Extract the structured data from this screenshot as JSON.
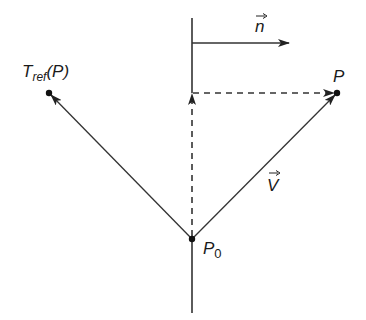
{
  "diagram": {
    "colors": {
      "stroke": "#333333",
      "point": "#111111",
      "background": "#ffffff"
    },
    "labels": {
      "normal": "n",
      "point_p": "P",
      "reflected_main": "T",
      "reflected_sub": "ref",
      "reflected_arg": "(P)",
      "vector_v": "V",
      "origin_main": "P",
      "origin_sub": "0"
    },
    "points": {
      "P0": [
        192,
        239
      ],
      "P": [
        337,
        93
      ],
      "T_ref_P": [
        49,
        93
      ],
      "plane_projection": [
        192,
        93
      ]
    },
    "elements": [
      {
        "type": "plane-line",
        "from": [
          192,
          18
        ],
        "to": [
          192,
          313
        ]
      },
      {
        "type": "normal-arrow",
        "from": [
          192,
          43
        ],
        "to": [
          290,
          43
        ],
        "label": "n"
      },
      {
        "type": "vector",
        "from": [
          192,
          239
        ],
        "to": [
          337,
          93
        ],
        "label": "V"
      },
      {
        "type": "vector",
        "from": [
          192,
          239
        ],
        "to": [
          49,
          93
        ],
        "label": "T_ref(P)"
      },
      {
        "type": "dashed-arrow",
        "from": [
          192,
          239
        ],
        "to": [
          192,
          93
        ]
      },
      {
        "type": "dashed-arrow",
        "from": [
          192,
          93
        ],
        "to": [
          337,
          93
        ]
      }
    ]
  }
}
